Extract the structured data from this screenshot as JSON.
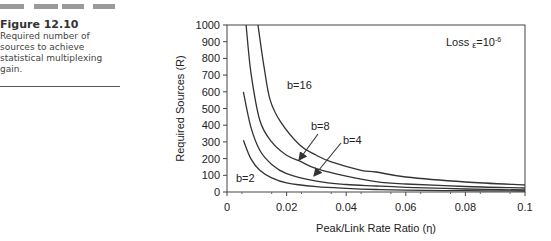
{
  "caption": {
    "figure_number": "Figure  12.10",
    "text": "Required number of sources to achieve statistical multiplexing gain."
  },
  "chart_data": {
    "type": "line",
    "title": "",
    "annotation": "Loss ε=10⁻⁶",
    "annotation_parts": {
      "prefix": "Loss ",
      "symbol": "ε",
      "eq": "=10",
      "exp": "-6"
    },
    "xlabel": "Peak/Link Rate Ratio (η)",
    "ylabel": "Required Sources (R)",
    "xlim": [
      0,
      0.1
    ],
    "ylim": [
      0,
      1000
    ],
    "x_ticks": [
      "0",
      "0.02",
      "0.04",
      "0.06",
      "0.08",
      "0.1"
    ],
    "y_ticks": [
      "0",
      "100",
      "200",
      "300",
      "400",
      "500",
      "600",
      "700",
      "800",
      "900",
      "1000"
    ],
    "grid": false,
    "legend": "inline labels",
    "series": [
      {
        "name": "b=2",
        "x": [
          0.0055,
          0.008,
          0.011,
          0.015,
          0.02,
          0.03,
          0.04,
          0.05,
          0.06,
          0.08,
          0.1
        ],
        "values": [
          310,
          200,
          130,
          85,
          55,
          32,
          22,
          15,
          11,
          8,
          6
        ]
      },
      {
        "name": "b=4",
        "x": [
          0.0055,
          0.008,
          0.011,
          0.015,
          0.02,
          0.03,
          0.04,
          0.05,
          0.06,
          0.08,
          0.1
        ],
        "values": [
          600,
          390,
          250,
          165,
          110,
          65,
          45,
          36,
          28,
          18,
          12
        ]
      },
      {
        "name": "b=8",
        "x": [
          0.0064,
          0.008,
          0.011,
          0.015,
          0.02,
          0.025,
          0.03,
          0.04,
          0.05,
          0.06,
          0.08,
          0.1
        ],
        "values": [
          1000,
          720,
          430,
          300,
          220,
          180,
          140,
          95,
          62,
          48,
          33,
          24
        ]
      },
      {
        "name": "b=16",
        "x": [
          0.0104,
          0.0125,
          0.0145,
          0.018,
          0.0245,
          0.03,
          0.035,
          0.045,
          0.05,
          0.06,
          0.08,
          0.1
        ],
        "values": [
          1000,
          740,
          550,
          420,
          280,
          220,
          180,
          130,
          120,
          90,
          60,
          42
        ]
      }
    ],
    "labels": [
      {
        "text": "b=16"
      },
      {
        "text": "b=8"
      },
      {
        "text": "b=4"
      },
      {
        "text": "b=2"
      }
    ]
  }
}
